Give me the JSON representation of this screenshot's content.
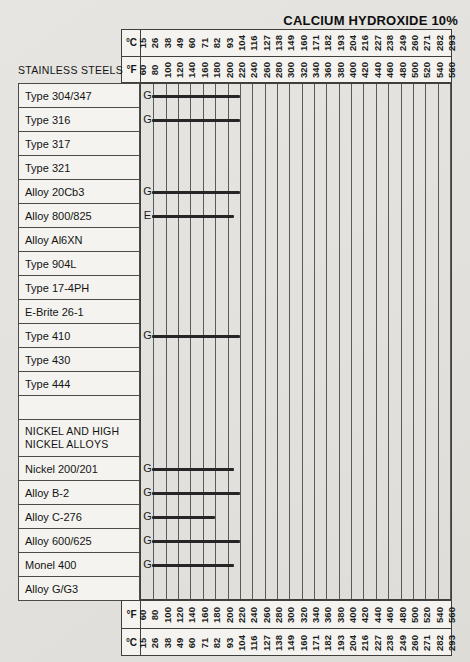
{
  "colors": {
    "page_bg": "#e3e2de",
    "box_bg": "#f4f3ef",
    "border": "#3f3f3d",
    "grid_line": "#5a5a57",
    "bar": "#262626",
    "text": "#161616"
  },
  "chart_data": {
    "type": "bar",
    "title": "CALCIUM HYDROXIDE 10%",
    "orientation": "horizontal-range-bars",
    "axis": {
      "celsius_label": "°C",
      "fahrenheit_label": "°F",
      "celsius_ticks": [
        15,
        26,
        38,
        49,
        60,
        71,
        82,
        93,
        104,
        116,
        127,
        138,
        149,
        160,
        171,
        182,
        193,
        204,
        216,
        227,
        238,
        249,
        260,
        271,
        282,
        293
      ],
      "fahrenheit_ticks": [
        60,
        80,
        100,
        120,
        140,
        160,
        180,
        200,
        220,
        240,
        260,
        280,
        300,
        320,
        340,
        360,
        380,
        400,
        420,
        440,
        460,
        480,
        500,
        520,
        540,
        560
      ],
      "fahrenheit_range": [
        60,
        560
      ],
      "tick_step_f": 20,
      "axis_repeated_bottom": true,
      "grid": "vertical-lines-only"
    },
    "rating_letters_shown": [
      "G",
      "E"
    ],
    "groups": [
      {
        "label": "STAINLESS STEELS",
        "label_position": "outside-left-of-axis",
        "rows": [
          {
            "name": "Type 304/347",
            "rating": "G",
            "range_f": [
              60,
              220
            ]
          },
          {
            "name": "Type 316",
            "rating": "G",
            "range_f": [
              60,
              220
            ]
          },
          {
            "name": "Type 317",
            "rating": null,
            "range_f": null
          },
          {
            "name": "Type 321",
            "rating": null,
            "range_f": null
          },
          {
            "name": "Alloy 20Cb3",
            "rating": "G",
            "range_f": [
              60,
              220
            ]
          },
          {
            "name": "Alloy 800/825",
            "rating": "E",
            "range_f": [
              60,
              210
            ]
          },
          {
            "name": "Alloy Al6XN",
            "rating": null,
            "range_f": null
          },
          {
            "name": "Type 904L",
            "rating": null,
            "range_f": null
          },
          {
            "name": "Type 17-4PH",
            "rating": null,
            "range_f": null
          },
          {
            "name": "E-Brite 26-1",
            "rating": null,
            "range_f": null
          },
          {
            "name": "Type 410",
            "rating": "G",
            "range_f": [
              60,
              220
            ]
          },
          {
            "name": "Type 430",
            "rating": null,
            "range_f": null
          },
          {
            "name": "Type 444",
            "rating": null,
            "range_f": null
          }
        ]
      },
      {
        "label": "NICKEL AND HIGH NICKEL ALLOYS",
        "label_lines": [
          "NICKEL AND HIGH",
          "NICKEL ALLOYS"
        ],
        "label_position": "in-row-box",
        "leading_blank_row": true,
        "rows": [
          {
            "name": "Nickel 200/201",
            "rating": "G",
            "range_f": [
              60,
              210
            ]
          },
          {
            "name": "Alloy B-2",
            "rating": "G",
            "range_f": [
              60,
              220
            ]
          },
          {
            "name": "Alloy C-276",
            "rating": "G",
            "range_f": [
              60,
              180
            ]
          },
          {
            "name": "Alloy 600/625",
            "rating": "G",
            "range_f": [
              60,
              220
            ]
          },
          {
            "name": "Monel 400",
            "rating": "G",
            "range_f": [
              60,
              210
            ]
          },
          {
            "name": "Alloy G/G3",
            "rating": null,
            "range_f": null
          }
        ]
      }
    ]
  }
}
